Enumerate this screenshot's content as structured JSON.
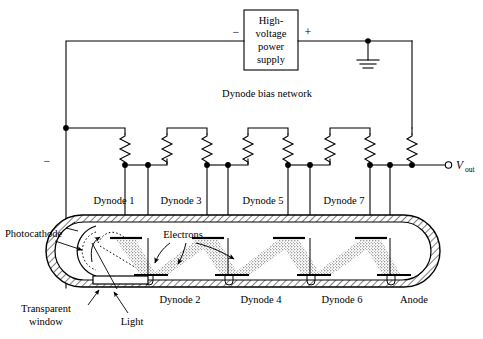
{
  "figure": {
    "title_block": {
      "name": "high-voltage-power-supply",
      "line1": "High-",
      "line2": "voltage",
      "line3": "power",
      "line4": "supply",
      "minus_terminal": "−",
      "plus_terminal": "+"
    },
    "network_label": "Dynode bias network",
    "left_minus": "−",
    "output": {
      "symbol": "V",
      "subscript": "out"
    },
    "top_electrode_labels": [
      "Dynode 1",
      "Dynode 3",
      "Dynode 5",
      "Dynode 7"
    ],
    "bottom_electrode_labels": [
      "Dynode 2",
      "Dynode 4",
      "Dynode 6",
      "Anode"
    ],
    "callouts": {
      "photocathode": "Photocathode",
      "electrons": "Electrons",
      "transparent_window_line1": "Transparent",
      "transparent_window_line2": "window",
      "light": "Light"
    },
    "colors": {
      "ink": "#000000",
      "paper": "#ffffff"
    },
    "counts": {
      "resistors": 8,
      "dynodes": 7,
      "anodes": 1
    }
  }
}
